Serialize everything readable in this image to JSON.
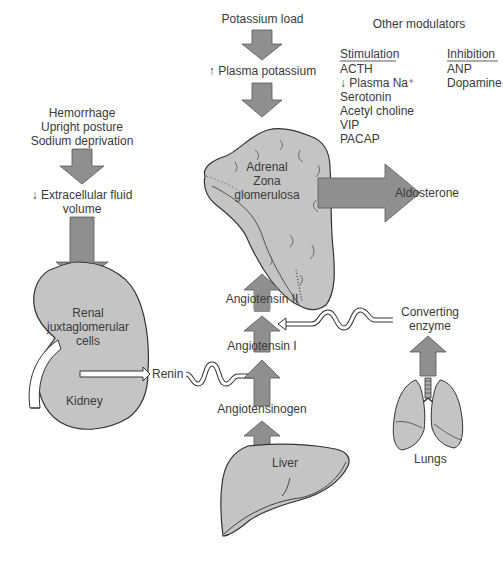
{
  "colors": {
    "organ_fill": "#c4c4c4",
    "arrow_fill": "#8f8f8f",
    "stroke": "#333333",
    "text": "#3a3a3a"
  },
  "stimuli": {
    "left": [
      "Hemorrhage",
      "Upright posture",
      "Sodium deprivation"
    ],
    "ecf_volume": "↓ Extracellular fluid",
    "ecf_volume_2": "volume",
    "potassium_load": "Potassium load",
    "plasma_potassium": "↑ Plasma potassium"
  },
  "kidney": {
    "label_1": "Renal",
    "label_2": "juxtaglomerular",
    "label_3": "cells",
    "organ": "Kidney"
  },
  "adrenal": {
    "label_1": "Adrenal",
    "label_2": "Zona",
    "label_3": "glomerulosa",
    "output": "Aldosterone"
  },
  "cascade": {
    "renin": "Renin",
    "angiotensinogen": "Angiotensinogen",
    "angiotensin_i": "Angiotensin I",
    "angiotensin_ii": "Angiotensin II",
    "liver": "Liver",
    "converting_enzyme_1": "Converting",
    "converting_enzyme_2": "enzyme",
    "lungs": "Lungs"
  },
  "modulators": {
    "title": "Other modulators",
    "stimulation_header": "Stimulation",
    "inhibition_header": "Inhibition",
    "stimulation": [
      "ACTH",
      "↓ Plasma Na⁺",
      "Serotonin",
      "Acetyl choline",
      "VIP",
      "PACAP"
    ],
    "inhibition": [
      "ANP",
      "Dopamine"
    ]
  }
}
